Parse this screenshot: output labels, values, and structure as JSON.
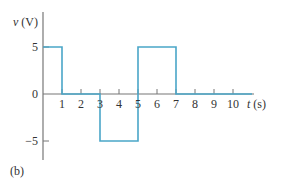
{
  "chart_data": {
    "type": "line",
    "step": true,
    "title": "",
    "panel_label": "(b)",
    "xlabel": {
      "var": "t",
      "unit": "(s)"
    },
    "ylabel": {
      "var": "v",
      "unit": "(V)"
    },
    "xlim": [
      0,
      11
    ],
    "ylim": [
      -6.5,
      8.5
    ],
    "x_ticks": [
      1,
      2,
      3,
      4,
      5,
      6,
      7,
      8,
      9,
      10
    ],
    "x_tick_labels": [
      "1",
      "2",
      "3",
      "4",
      "5",
      "6",
      "7",
      "8",
      "9",
      "10"
    ],
    "y_ticks": [
      5,
      0,
      -5
    ],
    "y_tick_labels": [
      "5",
      "0",
      "−5"
    ],
    "grid": false,
    "series": [
      {
        "name": "v(t)",
        "color": "#4aa6c8",
        "points": [
          [
            0,
            5
          ],
          [
            1,
            5
          ],
          [
            1,
            0
          ],
          [
            3,
            0
          ],
          [
            3,
            -5
          ],
          [
            5,
            -5
          ],
          [
            5,
            5
          ],
          [
            7,
            5
          ],
          [
            7,
            0
          ],
          [
            11,
            0
          ]
        ]
      }
    ],
    "axis_color": "#777777"
  }
}
